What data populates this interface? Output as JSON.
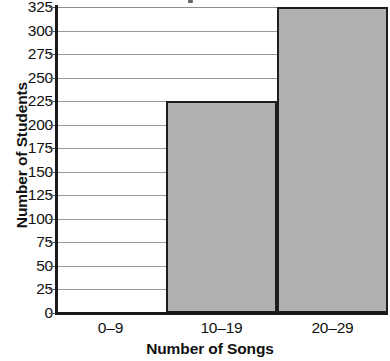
{
  "chart_data": {
    "type": "bar",
    "title": "",
    "xlabel": "Number of Songs",
    "ylabel": "Number of Students",
    "categories": [
      "0–9",
      "10–19",
      "20–29"
    ],
    "values": [
      0,
      225,
      325
    ],
    "ylim": [
      0,
      325
    ],
    "y_tick_step": 25,
    "y_ticks": [
      0,
      25,
      50,
      75,
      100,
      125,
      150,
      175,
      200,
      225,
      250,
      275,
      300,
      325
    ],
    "y_tick_labels": [
      "0",
      "25",
      "50",
      "75",
      "100",
      "125",
      "150",
      "175",
      "200",
      "225",
      "250",
      "275",
      "300",
      "325"
    ],
    "grid": true,
    "grid_axis": "y",
    "legend": false,
    "legend_position": "none",
    "bar_fill_color": "#b1b1b1",
    "bar_edge_color": "#1d1d1d",
    "gridline_color": "#9a9a9a",
    "axis_color": "#1a1a1a",
    "text_color": "#111111",
    "background_color": "#ffffff",
    "series": [
      {
        "name": "Number of Students",
        "values": [
          0,
          225,
          325
        ]
      }
    ],
    "annotations": []
  }
}
